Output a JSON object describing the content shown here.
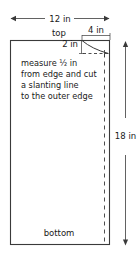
{
  "diagram": {
    "colors": {
      "outline": "#3a3a3a",
      "dashed": "#3a3a3a",
      "dimension": "#3a3a3a",
      "text": "#1a1a1a",
      "background": "#ffffff"
    },
    "dimensions": {
      "width_label": "12 in",
      "height_label": "18 in",
      "corner_width_label": "4 in",
      "corner_depth_label": "2 in"
    },
    "edge_labels": {
      "top": "top",
      "bottom": "bottom"
    },
    "instruction_lines": [
      "measure ½ in",
      "from edge and cut",
      "a slanting line",
      "to the outer edge"
    ],
    "instruction_full": "measure ½ in from edge and cut a slanting line to the outer edge"
  }
}
